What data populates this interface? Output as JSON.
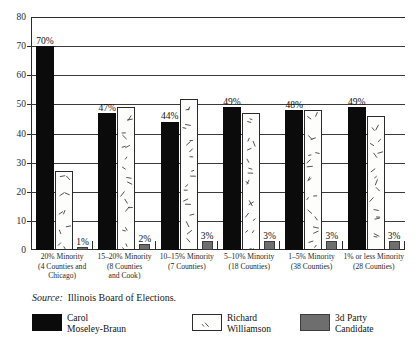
{
  "chart_data": {
    "type": "bar",
    "title": "",
    "xlabel": "",
    "ylabel": "",
    "ylim": [
      0,
      80
    ],
    "yticks": [
      0,
      10,
      20,
      30,
      40,
      50,
      60,
      70,
      80
    ],
    "grid": true,
    "legend_position": "bottom",
    "categories": [
      "20% Minority (4 Counties and Chicago)",
      "15–20% Minority (8 Counties and Cook)",
      "10–15% Minority (7 Counties)",
      "5–10% Minority (18 Counties)",
      "1–5% Minority (38 Counties)",
      "1% or less Minority (28 Counties)"
    ],
    "category_lines": [
      [
        "20% Minority",
        "(4 Counties and",
        "Chicago)"
      ],
      [
        "15–20% Minority",
        "(8 Counties",
        "and Cook)"
      ],
      [
        "10–15% Minority",
        "(7 Counties)"
      ],
      [
        "5–10% Minority",
        "(18 Counties)"
      ],
      [
        "1–5% Minority",
        "(38 Counties)"
      ],
      [
        "1% or less Minority",
        "(28 Counties)"
      ]
    ],
    "series": [
      {
        "name": "Carol Moseley-Braun",
        "values": [
          70,
          47,
          44,
          49,
          48,
          49
        ],
        "labels": [
          "70%",
          "47%",
          "44%",
          "49%",
          "48%",
          "49%"
        ],
        "color": "#0b0b0b",
        "fill": "solid-black"
      },
      {
        "name": "Richard Williamson",
        "values": [
          27,
          49,
          52,
          47,
          48,
          46
        ],
        "labels": [
          "27%",
          "49%",
          "52%",
          "47%",
          "48%",
          "46%"
        ],
        "color": "#ffffff",
        "fill": "hatched-white"
      },
      {
        "name": "3d Party Candidate",
        "values": [
          1,
          2,
          3,
          3,
          3,
          3
        ],
        "labels": [
          "1%",
          "2%",
          "3%",
          "3%",
          "3%",
          "3%"
        ],
        "color": "#6e6e6e",
        "fill": "solid-gray"
      }
    ]
  },
  "source": {
    "word": "Source:",
    "text": "Illinois Board of Elections."
  },
  "legend": {
    "items": [
      {
        "swatch": "solid-black",
        "lines": [
          "Carol",
          "Moseley-Braun"
        ]
      },
      {
        "swatch": "hatched-white",
        "lines": [
          "Richard",
          "Williamson"
        ]
      },
      {
        "swatch": "solid-gray",
        "lines": [
          "3d Party",
          "Candidate"
        ]
      }
    ]
  }
}
